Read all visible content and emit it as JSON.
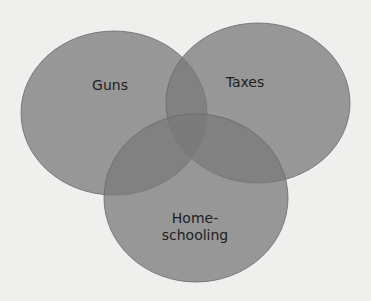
{
  "diagram": {
    "type": "venn",
    "colors": {
      "background": "#efefed",
      "fill": "#7a7a7a",
      "stroke": "#6a6a6a",
      "text": "#1e1e1e"
    },
    "sets": [
      {
        "label": "Guns"
      },
      {
        "label": "Taxes"
      },
      {
        "label": "Home-\nschooling",
        "line1": "Home-",
        "line2": "schooling"
      }
    ]
  }
}
